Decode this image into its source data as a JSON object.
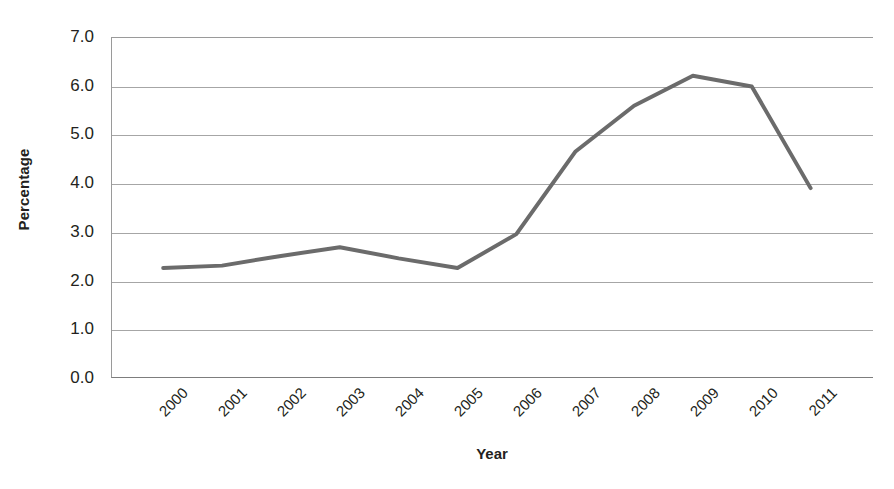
{
  "chart_data": {
    "type": "line",
    "title": "",
    "xlabel": "Year",
    "ylabel": "Percentage",
    "categories": [
      "2000",
      "2001",
      "2002",
      "2003",
      "2004",
      "2005",
      "2006",
      "2007",
      "2008",
      "2009",
      "2010",
      "2011"
    ],
    "values": [
      2.25,
      2.3,
      2.5,
      2.68,
      2.45,
      2.25,
      2.95,
      4.65,
      5.6,
      6.22,
      6.0,
      3.9
    ],
    "series": [
      {
        "name": "Percentage",
        "values": [
          2.25,
          2.3,
          2.5,
          2.68,
          2.45,
          2.25,
          2.95,
          4.65,
          5.6,
          6.22,
          6.0,
          3.9
        ],
        "color": "#6b6b6b"
      }
    ],
    "ylim": [
      0.0,
      7.0
    ],
    "ytick_labels": [
      "7.0",
      "6.0",
      "5.0",
      "4.0",
      "3.0",
      "2.0",
      "1.0",
      "0.0"
    ],
    "ytick_values": [
      7.0,
      6.0,
      5.0,
      4.0,
      3.0,
      2.0,
      1.0,
      0.0
    ],
    "grid": true,
    "grid_color": "#a6a6a6",
    "legend": false,
    "legend_position": "none",
    "markers": false,
    "line_width": 4,
    "xtick_rotation": -45,
    "plot_background": "#ffffff",
    "axis_color": "#7d7d7d"
  }
}
